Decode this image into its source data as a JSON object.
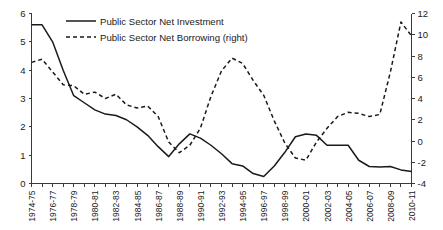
{
  "chart_data": {
    "type": "line",
    "title": "",
    "subtitle": "",
    "xlabel": "",
    "ylabel": "",
    "y2label": "",
    "grid": false,
    "legend_position": "top-center",
    "x": [
      "1974-75",
      "1975-76",
      "1976-77",
      "1977-78",
      "1978-79",
      "1979-80",
      "1980-81",
      "1981-82",
      "1982-83",
      "1983-84",
      "1984-85",
      "1985-86",
      "1986-87",
      "1987-88",
      "1988-89",
      "1989-90",
      "1990-91",
      "1991-92",
      "1992-93",
      "1993-94",
      "1994-95",
      "1995-96",
      "1996-97",
      "1997-98",
      "1998-99",
      "1999-00",
      "2000-01",
      "2001-02",
      "2002-03",
      "2003-04",
      "2004-05",
      "2005-06",
      "2006-07",
      "2007-08",
      "2008-09",
      "2009-10",
      "2010-11"
    ],
    "xtick_labels": [
      "1974-75",
      "1976-77",
      "1978-79",
      "1980-81",
      "1982-83",
      "1984-85",
      "1986-87",
      "1988-89",
      "1990-91",
      "1992-93",
      "1994-95",
      "1996-97",
      "1998-99",
      "2000-01",
      "2002-03",
      "2004-05",
      "2006-07",
      "2008-09",
      "2010-11"
    ],
    "ylim": [
      0,
      6
    ],
    "yticks": [
      0,
      1,
      2,
      3,
      4,
      5,
      6
    ],
    "y2lim": [
      -4,
      12
    ],
    "y2ticks": [
      -4,
      -2,
      0,
      2,
      4,
      6,
      8,
      10,
      12
    ],
    "series": [
      {
        "name": "Public Sector Net Investment",
        "axis": "left",
        "style": "solid",
        "color": "#1a1a1a",
        "values": [
          5.6,
          5.6,
          5.0,
          4.0,
          3.1,
          2.85,
          2.6,
          2.45,
          2.4,
          2.25,
          2.0,
          1.7,
          1.3,
          0.95,
          1.4,
          1.75,
          1.6,
          1.35,
          1.05,
          0.7,
          0.62,
          0.35,
          0.25,
          0.62,
          1.1,
          1.65,
          1.75,
          1.7,
          1.35,
          1.35,
          1.35,
          0.82,
          0.6,
          0.58,
          0.6,
          0.48,
          0.42
        ]
      },
      {
        "name": "Public Sector Net Borrowing (right)",
        "axis": "right",
        "style": "dashed",
        "color": "#1a1a1a",
        "values": [
          7.4,
          7.7,
          6.5,
          5.3,
          5.2,
          4.4,
          4.6,
          4.0,
          4.4,
          3.4,
          3.1,
          3.3,
          2.3,
          -0.1,
          -1.1,
          -0.4,
          1.2,
          4.2,
          6.6,
          7.8,
          7.3,
          5.7,
          4.3,
          1.9,
          -0.2,
          -1.6,
          -1.8,
          -0.1,
          1.2,
          2.3,
          2.7,
          2.6,
          2.3,
          2.5,
          6.5,
          11.2,
          9.9
        ]
      }
    ]
  },
  "legend": {
    "items": [
      {
        "label": "Public Sector Net Investment",
        "style": "solid"
      },
      {
        "label": "Public Sector Net Borrowing (right)",
        "style": "dashed"
      }
    ]
  }
}
